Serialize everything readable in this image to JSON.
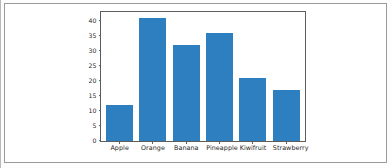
{
  "figure": {
    "background_color": "#ffffff",
    "frame_color": "#9a9a9a"
  },
  "chart_data": {
    "type": "bar",
    "title": "",
    "xlabel": "",
    "ylabel": "",
    "categories": [
      "Apple",
      "Orange",
      "Banana",
      "Pineapple",
      "Kiwifruit",
      "Strawberry"
    ],
    "values": [
      12,
      41,
      32,
      36,
      21,
      17
    ],
    "yticks": [
      0,
      5,
      10,
      15,
      20,
      25,
      30,
      35,
      40
    ],
    "ytick_labels": [
      "0",
      "5",
      "10",
      "15",
      "20",
      "25",
      "30",
      "35",
      "40"
    ],
    "ylim": [
      0,
      43
    ],
    "grid": false,
    "legend": null,
    "bar_color": "#2e7fc0",
    "axis_color": "#5d5d5d"
  }
}
